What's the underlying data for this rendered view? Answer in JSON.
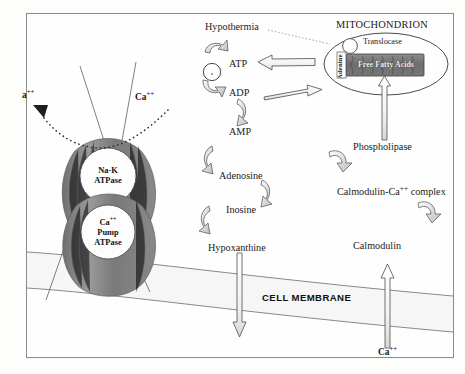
{
  "figure": {
    "domain": "biological-pathway-diagram",
    "background_color": "#fdfdfc",
    "border_color": "#8a8a8a",
    "ink_color": "#1b1b1b"
  },
  "membrane": {
    "label": "CELL MEMBRANE"
  },
  "mitochondrion": {
    "title": "MITOCHONDRION",
    "translocase_label": "Translocase",
    "adenine_label": "Adenine",
    "free_fatty_acids_label": "Free Fatty Acids"
  },
  "pumps": {
    "sodium_potassium": {
      "line1": "Na-K",
      "line2": "ATPase"
    },
    "calcium": {
      "line1": "Ca",
      "line1_sup": "++",
      "line2": "Pump",
      "line3": "ATPase"
    }
  },
  "ions": {
    "efflux_left": "a",
    "efflux_left_sup": "++",
    "influx_top": "Ca",
    "influx_top_sup": "++",
    "influx_bottom": "Ca",
    "influx_bottom_sup": "++"
  },
  "stimulus": {
    "hypothermia": "Hypothermia"
  },
  "cascade": {
    "title": "ATP degradation cascade",
    "steps": [
      {
        "id": "atp",
        "label": "ATP"
      },
      {
        "id": "adp",
        "label": "ADP"
      },
      {
        "id": "amp",
        "label": "AMP"
      },
      {
        "id": "adenosine",
        "label": "Adenosine"
      },
      {
        "id": "inosine",
        "label": "Inosine"
      },
      {
        "id": "hypoxanthine",
        "label": "Hypoxanthine"
      }
    ]
  },
  "calcium_pathway": {
    "steps": [
      {
        "id": "phospholipase",
        "label": "Phospholipase"
      },
      {
        "id": "calmodulin_complex",
        "label": "Calmodulin-Ca",
        "sup": "++",
        "suffix": " complex"
      },
      {
        "id": "calmodulin",
        "label": "Calmodulin"
      }
    ]
  }
}
